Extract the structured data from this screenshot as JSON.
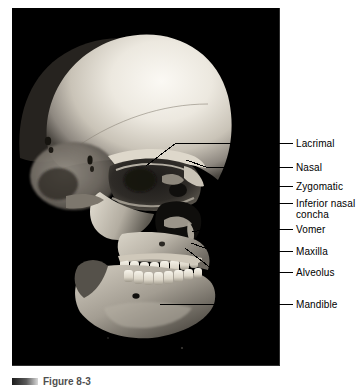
{
  "figure": {
    "caption_label": "Figure 8-3",
    "photo_background": "#000000",
    "label_color": "#000000",
    "leader_color": "#000000"
  },
  "labels": [
    {
      "line1": "Lacrimal",
      "line2": "",
      "y": 138
    },
    {
      "line1": "Nasal",
      "line2": "",
      "y": 162
    },
    {
      "line1": "Zygomatic",
      "line2": "",
      "y": 181
    },
    {
      "line1": "Inferior nasal",
      "line2": "concha",
      "y": 198
    },
    {
      "line1": "Vomer",
      "line2": "",
      "y": 224
    },
    {
      "line1": "Maxilla",
      "line2": "",
      "y": 246
    },
    {
      "line1": "Alveolus",
      "line2": "",
      "y": 267
    },
    {
      "line1": "Mandible",
      "line2": "",
      "y": 299
    }
  ],
  "leaders": [
    {
      "name": "leader-lacrimal",
      "points": "293,143 225,143 176,143 146,166"
    },
    {
      "name": "leader-nasal",
      "points": "293,167 206,167 186,160"
    },
    {
      "name": "leader-zygomatic",
      "points": "293,186 211,186"
    },
    {
      "name": "leader-inferior-nasal",
      "points": "293,203 200,203"
    },
    {
      "name": "leader-vomer",
      "points": "293,229 207,229 192,232"
    },
    {
      "name": "leader-maxilla",
      "points": "293,251 213,251 191,243"
    },
    {
      "name": "leader-alveolus",
      "points": "293,272 216,272 185,248"
    },
    {
      "name": "leader-mandible",
      "points": "293,304 160,304"
    }
  ],
  "photo": {
    "subject": "human-skull-lateral-oblique-view",
    "cranium_highlight": "#f2efe8",
    "bone_midtone": "#b9b3a8",
    "bone_shadow": "#4a463f",
    "cavity_dark": "#171514"
  }
}
